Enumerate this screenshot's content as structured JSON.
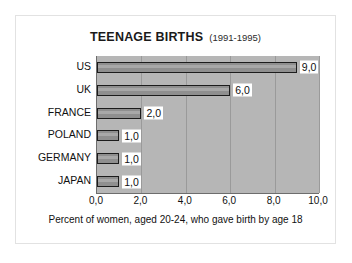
{
  "chart_data": {
    "type": "bar",
    "orientation": "horizontal",
    "title": "TEENAGE BIRTHS",
    "subtitle": "(1991-1995)",
    "categories": [
      "US",
      "UK",
      "FRANCE",
      "POLAND",
      "GERMANY",
      "JAPAN"
    ],
    "values": [
      9.0,
      6.0,
      2.0,
      1.0,
      1.0,
      1.0
    ],
    "value_labels": [
      "9,0",
      "6,0",
      "2,0",
      "1,0",
      "1,0",
      "1,0"
    ],
    "xlabel": "Percent of women, aged 20-24, who gave birth by age 18",
    "ylabel": "",
    "xlim": [
      0,
      10
    ],
    "xticks": [
      0,
      2,
      4,
      6,
      8,
      10
    ],
    "xtick_labels": [
      "0,0",
      "2,0",
      "4,0",
      "6,0",
      "8,0",
      "10,0"
    ],
    "grid": "vertical",
    "legend": "none",
    "colors": {
      "plot_background": "#b6b6b6",
      "bar_fill": "#8f8f8f",
      "bar_border": "#1c1c1c",
      "gridline": "#9a9a9a",
      "axis": "#6d6d6d",
      "card_background": "#ffffff",
      "text": "#111111"
    }
  }
}
